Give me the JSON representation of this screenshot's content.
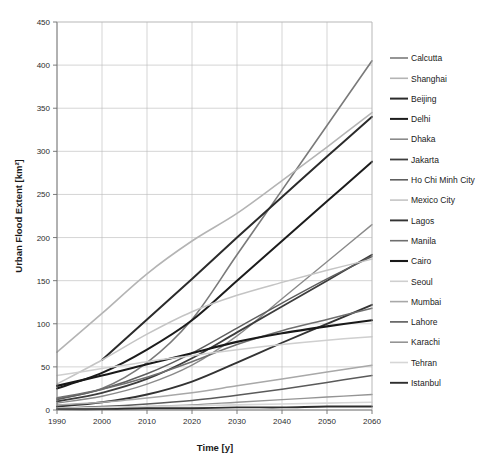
{
  "chart_data": {
    "type": "line",
    "title": "",
    "xlabel": "Time [y]",
    "ylabel": "Urban Flood Extent [km²]",
    "xlim": [
      1990,
      2060
    ],
    "ylim": [
      0,
      450
    ],
    "xticks": [
      1990,
      2000,
      2010,
      2020,
      2030,
      2040,
      2050,
      2060
    ],
    "yticks": [
      0,
      50,
      100,
      150,
      200,
      250,
      300,
      350,
      400,
      450
    ],
    "grid": true,
    "legend_position": "right",
    "x": [
      1990,
      2000,
      2010,
      2020,
      2030,
      2040,
      2050,
      2060
    ],
    "series": [
      {
        "name": "Calcutta",
        "color": "#7a7a7a",
        "width": 1.6,
        "x": [
          1990,
          2000,
          2010,
          2020,
          2030,
          2040,
          2050,
          2060
        ],
        "values": [
          13,
          25,
          55,
          105,
          180,
          255,
          330,
          405
        ]
      },
      {
        "name": "Shanghai",
        "color": "#b4b4b4",
        "width": 1.6,
        "x": [
          1990,
          2000,
          2010,
          2020,
          2030,
          2040,
          2050,
          2060
        ],
        "values": [
          67,
          112,
          158,
          196,
          228,
          266,
          305,
          345
        ]
      },
      {
        "name": "Beijing",
        "color": "#2b2b2b",
        "width": 2.0,
        "x": [
          2000,
          2010,
          2020,
          2030,
          2040,
          2050,
          2060
        ],
        "values": [
          58,
          105,
          152,
          200,
          247,
          294,
          340
        ]
      },
      {
        "name": "Delhi",
        "color": "#1c1c1c",
        "width": 2.0,
        "x": [
          1990,
          2000,
          2010,
          2020,
          2030,
          2040,
          2050,
          2060
        ],
        "values": [
          25,
          43,
          70,
          104,
          150,
          196,
          242,
          288
        ]
      },
      {
        "name": "Dhaka",
        "color": "#8a8a8a",
        "width": 1.4,
        "x": [
          1990,
          2000,
          2010,
          2020,
          2030,
          2040,
          2050,
          2060
        ],
        "values": [
          8,
          16,
          30,
          52,
          86,
          129,
          172,
          215
        ]
      },
      {
        "name": "Jakarta",
        "color": "#3d3d3d",
        "width": 1.8,
        "x": [
          1990,
          2000,
          2010,
          2020,
          2030,
          2040,
          2050,
          2060
        ],
        "values": [
          10,
          20,
          36,
          60,
          90,
          120,
          150,
          180
        ]
      },
      {
        "name": "Ho Chi Minh City",
        "color": "#5e5e5e",
        "width": 1.5,
        "x": [
          1990,
          2000,
          2010,
          2020,
          2030,
          2040,
          2050,
          2060
        ],
        "values": [
          12,
          24,
          42,
          66,
          95,
          124,
          152,
          178
        ]
      },
      {
        "name": "Mexico City",
        "color": "#c4c4c4",
        "width": 1.5,
        "x": [
          1990,
          2000,
          2010,
          2020,
          2030,
          2040,
          2050,
          2060
        ],
        "values": [
          30,
          58,
          88,
          114,
          133,
          148,
          162,
          175
        ]
      },
      {
        "name": "Lagos",
        "color": "#333333",
        "width": 1.9,
        "x": [
          1990,
          2000,
          2010,
          2020,
          2030,
          2040,
          2050,
          2060
        ],
        "values": [
          4,
          9,
          18,
          33,
          55,
          78,
          100,
          122
        ]
      },
      {
        "name": "Manila",
        "color": "#6f6f6f",
        "width": 1.5,
        "x": [
          1990,
          2000,
          2010,
          2020,
          2030,
          2040,
          2050,
          2060
        ],
        "values": [
          14,
          24,
          38,
          56,
          76,
          92,
          105,
          118
        ]
      },
      {
        "name": "Cairo",
        "color": "#191919",
        "width": 2.1,
        "x": [
          1990,
          2000,
          2010,
          2020,
          2030,
          2040,
          2050,
          2060
        ],
        "values": [
          28,
          40,
          53,
          66,
          79,
          89,
          97,
          104
        ]
      },
      {
        "name": "Seoul",
        "color": "#cfcfcf",
        "width": 1.5,
        "x": [
          1990,
          2000,
          2010,
          2020,
          2030,
          2040,
          2050,
          2060
        ],
        "values": [
          40,
          48,
          56,
          63,
          70,
          76,
          81,
          85
        ]
      },
      {
        "name": "Mumbai",
        "color": "#a8a8a8",
        "width": 1.5,
        "x": [
          1990,
          2000,
          2010,
          2020,
          2030,
          2040,
          2050,
          2060
        ],
        "values": [
          6,
          9,
          14,
          20,
          28,
          36,
          44,
          52
        ]
      },
      {
        "name": "Lahore",
        "color": "#5a5a5a",
        "width": 1.5,
        "x": [
          1990,
          2000,
          2010,
          2020,
          2030,
          2040,
          2050,
          2060
        ],
        "values": [
          2,
          4,
          7,
          11,
          17,
          24,
          32,
          40
        ]
      },
      {
        "name": "Karachi",
        "color": "#949494",
        "width": 1.4,
        "x": [
          1990,
          2000,
          2010,
          2020,
          2030,
          2040,
          2050,
          2060
        ],
        "values": [
          1,
          2,
          4,
          6,
          9,
          12,
          15,
          18
        ]
      },
      {
        "name": "Tehran",
        "color": "#d6d6d6",
        "width": 1.6,
        "x": [
          1990,
          2000,
          2010,
          2020,
          2030,
          2040,
          2050,
          2060
        ],
        "values": [
          2,
          3,
          4,
          5,
          6,
          7,
          8,
          9
        ]
      },
      {
        "name": "Istanbul",
        "color": "#2e2e2e",
        "width": 1.9,
        "x": [
          1990,
          2000,
          2010,
          2020,
          2030,
          2040,
          2050,
          2060
        ],
        "values": [
          1,
          1,
          2,
          2,
          3,
          3,
          4,
          4
        ]
      }
    ]
  }
}
